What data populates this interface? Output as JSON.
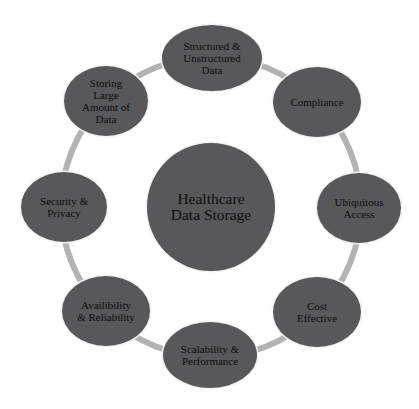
{
  "diagram": {
    "type": "radial-hub",
    "hub": {
      "label": "Healthcare\nData Storage",
      "cx": 211,
      "cy": 207,
      "r": 64
    },
    "ring": {
      "cx": 211,
      "cy": 207,
      "r": 150,
      "color": "#b3b3b3",
      "width": 6
    },
    "colors": {
      "node_fill": "#58585a",
      "text": "#0d0d0d",
      "background": "#ffffff"
    },
    "nodes": [
      {
        "id": "structured",
        "label": "Structured &\nUnstructured\nData",
        "cx": 212,
        "cy": 58,
        "rx": 50,
        "ry": 33
      },
      {
        "id": "compliance",
        "label": "Compliance",
        "cx": 317,
        "cy": 102,
        "rx": 44,
        "ry": 35
      },
      {
        "id": "ubiquitous",
        "label": "Ubiquitous\nAccess",
        "cx": 359,
        "cy": 208,
        "rx": 42,
        "ry": 35
      },
      {
        "id": "cost",
        "label": "Cost\nEffective",
        "cx": 317,
        "cy": 312,
        "rx": 44,
        "ry": 35
      },
      {
        "id": "scalability",
        "label": "Scalability &\nPerformance",
        "cx": 210,
        "cy": 355,
        "rx": 47,
        "ry": 33
      },
      {
        "id": "availability",
        "label": "Availibility\n& Reliability",
        "cx": 106,
        "cy": 311,
        "rx": 44,
        "ry": 35
      },
      {
        "id": "security",
        "label": "Security &\nPrivacy",
        "cx": 64,
        "cy": 207,
        "rx": 43,
        "ry": 35
      },
      {
        "id": "storing",
        "label": "Storing\nLarge\nAmount of\nData",
        "cx": 106,
        "cy": 101,
        "rx": 42,
        "ry": 35
      }
    ]
  }
}
